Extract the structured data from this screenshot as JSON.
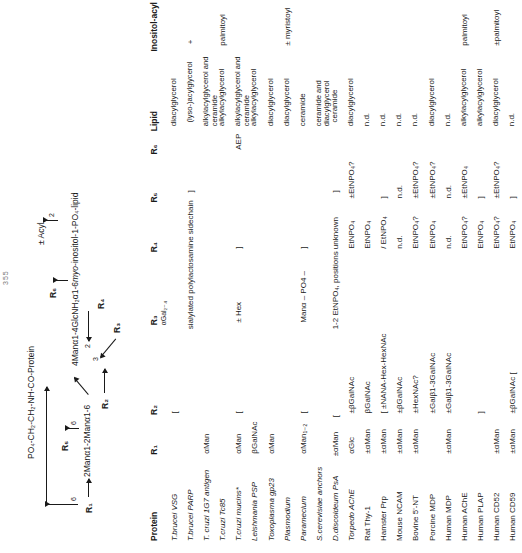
{
  "page_number": "355",
  "diagram": {
    "protein_backbone": "PO₄-CH₂-CH₂-NH-CO-Protein",
    "r1_label": "R₁",
    "r2_label": "R₂",
    "r3_label": "R₃",
    "r4_label": "R₄",
    "r5_label": "R₅",
    "r6_label": "R₆",
    "branch_6a": "6",
    "branch_6b": "6",
    "branch_3": "3",
    "branch_2a": "2",
    "branch_2b": "2",
    "acyl_label": "± Acyl",
    "core_left": "2Manα1-2Manα1-6",
    "core_right": "4Manα1-4GlcNH₂α1-6",
    "core_inositol": "myo",
    "core_tail": "-inositol-1-PO₄-lipid"
  },
  "table": {
    "headers": {
      "protein": "Protein",
      "r1": "R₁",
      "r2": "R₂",
      "r3": "R₃",
      "r4": "R₄",
      "r5": "R₅",
      "r6": "R₆",
      "lipid": "Lipid",
      "inositol_acyl": "Inositol-acyl"
    },
    "subheader_r3": "αGal₂₋₄",
    "rows": [
      {
        "protein": "T.brucei VSG",
        "italic": true,
        "r1": "",
        "r2": "[",
        "r3": "",
        "r4": "",
        "r5": "",
        "r6": "",
        "lipid": "diacylglycerol",
        "inositol": ""
      },
      {
        "protein": "T.brucei PARP",
        "italic": true,
        "r1": "",
        "r2": "",
        "r3": "sialylated polylactosamine sidechain",
        "r4": "",
        "r5": "]",
        "r6": "",
        "lipid": "(lyso-)acylglycerol",
        "inositol": "+"
      },
      {
        "protein": "T. cruzi 1G7 antigen",
        "italic": true,
        "r1": "αMan",
        "r2": "",
        "r3": "",
        "r4": "",
        "r5": "",
        "r6": "",
        "lipid": "alkylacylglycerol and ceramide",
        "inositol": ""
      },
      {
        "protein": "T.cruzi Tc85",
        "italic": true,
        "r1": "",
        "r2": "",
        "r3": "",
        "r4": "",
        "r5": "",
        "r6": "",
        "lipid": "alkylacylglycerol",
        "inositol": "palmitoyl"
      },
      {
        "protein": "T.cruzi mucins*",
        "italic": true,
        "r1": "αMan",
        "r2": "[",
        "r3": "± Hex",
        "r4": "]",
        "r5": "",
        "r6": "AEP",
        "lipid": "alkylacylglycerol and ceramide",
        "inositol": ""
      },
      {
        "protein": "Leishmania  PSP",
        "italic": true,
        "r1": "βGalNAc",
        "r2": "",
        "r3": "",
        "r4": "",
        "r5": "",
        "r6": "",
        "lipid": "alkylacylglycerol",
        "inositol": ""
      },
      {
        "protein": "Toxoplasma  gp23",
        "italic": true,
        "r1": "αMan",
        "r2": "",
        "r3": "",
        "r4": "",
        "r5": "",
        "r6": "",
        "lipid": "diacylglycerol",
        "inositol": ""
      },
      {
        "protein": "Plasmodium",
        "italic": true,
        "r1": "",
        "r2": "",
        "r3": "",
        "r4": "",
        "r5": "",
        "r6": "",
        "lipid": "diacylglycerol",
        "inositol": "± myristoyl"
      },
      {
        "protein": "Paramecium",
        "italic": true,
        "r1": "αMan₁₋₂",
        "r2": "[",
        "r3": "Manα – PO4 –",
        "r4": "]",
        "r5": "",
        "r6": "",
        "lipid": "ceramide",
        "inositol": ""
      },
      {
        "protein": "S.cerevisiae  anchors",
        "italic": true,
        "r1": "",
        "r2": "",
        "r3": "",
        "r4": "",
        "r5": "",
        "r6": "",
        "lipid": "ceramide and diacylglycerol",
        "inositol": ""
      },
      {
        "protein": "D.discoideum PsA",
        "italic": true,
        "r1": "±αMan",
        "r2": "[",
        "r3": "1-2 EtNPO₄, positions unknown",
        "r4": "",
        "r5": "]",
        "r6": "",
        "lipid": "ceramide",
        "inositol": ""
      },
      {
        "protein": "Torpedo AChE",
        "italic": true,
        "r1": "αGlc",
        "r2": "±βGalNAc",
        "r3": "",
        "r4": "EtNPO₄",
        "r5": "±EtNPO₄?",
        "r6": "",
        "lipid": "diacylglycerol",
        "inositol": ""
      },
      {
        "protein": "Rat Thy-1",
        "italic": false,
        "r1": "±αMan",
        "r2": "βGalNAc",
        "r3": "",
        "r4": "EtNPO₄",
        "r5": "",
        "r6": "",
        "lipid": "n.d.",
        "inositol": ""
      },
      {
        "protein": "Hamster Prp",
        "italic": false,
        "r1": "±αMan",
        "r2": "[   ±NANA-Hex-HexNAc",
        "r3": "",
        "r4": "/   EtNPO₄",
        "r5": "]",
        "r6": "",
        "lipid": "n.d.",
        "inositol": ""
      },
      {
        "protein": "Mouse NCAM",
        "italic": false,
        "r1": "±αMan",
        "r2": "±βGalNAc",
        "r3": "",
        "r4": "n.d.",
        "r5": "n.d.",
        "r6": "",
        "lipid": "n.d.",
        "inositol": ""
      },
      {
        "protein": "Bovine 5'-NT",
        "italic": false,
        "r1": "±αMan",
        "r2": "±HexNAc?",
        "r3": "",
        "r4": "EtNPO₄?",
        "r5": "±EtNPO₄?",
        "r6": "",
        "lipid": "n.d.",
        "inositol": ""
      },
      {
        "protein": "Porcine MDP",
        "italic": false,
        "r1": "",
        "r2": "±Galβ1-3GalNAc",
        "r3": "",
        "r4": "EtNPO₄",
        "r5": "±EtNPO₄?",
        "r6": "",
        "lipid": "diacylglycerol",
        "inositol": ""
      },
      {
        "protein": "Human MDP",
        "italic": false,
        "r1": "±αMan",
        "r2": "±Galβ1-3GalNAc",
        "r3": "",
        "r4": "n.d.",
        "r5": "n.d.",
        "r6": "",
        "lipid": "n.d.",
        "inositol": ""
      },
      {
        "protein": "Human AChE",
        "italic": false,
        "r1": "",
        "r2": "",
        "r3": "",
        "r4": "EtNPO₄?",
        "r5": "±EtNPO₄",
        "r6": "",
        "lipid": "alkylacylglycerol",
        "inositol": "palmitoyl"
      },
      {
        "protein": "Human PLAP",
        "italic": false,
        "r1": "",
        "r2": "]",
        "r3": "",
        "r4": "EtNPO₄",
        "r5": "]",
        "r6": "",
        "lipid": "alkylacylglycerol",
        "inositol": ""
      },
      {
        "protein": "Human CD52",
        "italic": false,
        "r1": "±αMan",
        "r2": "",
        "r3": "",
        "r4": "EtNPO₄?",
        "r5": "±EtNPO₄?",
        "r6": "",
        "lipid": "diacylglycerol",
        "inositol": "±palmitoyl"
      },
      {
        "protein": "Human CD59",
        "italic": false,
        "r1": "±αMan",
        "r2": "±βGalNAc     [",
        "r3": "",
        "r4": "EtNPO₄",
        "r5": "]",
        "r6": "",
        "lipid": "n.d.",
        "inositol": ""
      }
    ]
  }
}
